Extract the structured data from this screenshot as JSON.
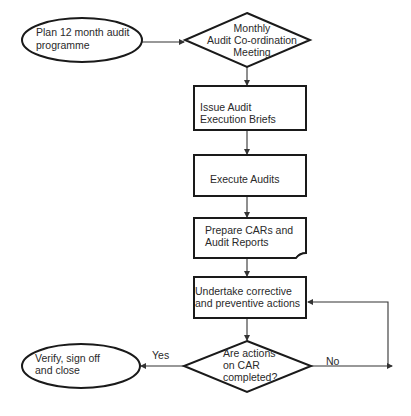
{
  "diagram": {
    "type": "flowchart",
    "title": "",
    "nodes": [
      {
        "id": "plan",
        "shape": "oval",
        "lines": [
          "Plan 12 month audit",
          "programme"
        ]
      },
      {
        "id": "meeting",
        "shape": "diamond",
        "lines": [
          "Monthly",
          "Audit Co-ordination",
          "Meeting"
        ]
      },
      {
        "id": "briefs",
        "shape": "rectangle",
        "lines": [
          "Issue Audit",
          "Execution Briefs"
        ]
      },
      {
        "id": "execute",
        "shape": "rectangle",
        "lines": [
          "Execute Audits"
        ]
      },
      {
        "id": "reports",
        "shape": "document",
        "lines": [
          "Prepare CARs and",
          "Audit Reports"
        ]
      },
      {
        "id": "corrective",
        "shape": "rectangle",
        "lines": [
          "Undertake corrective",
          "and preventive actions"
        ]
      },
      {
        "id": "decision",
        "shape": "diamond",
        "lines": [
          "Are actions",
          "on CAR",
          "completed?"
        ]
      },
      {
        "id": "close",
        "shape": "oval",
        "lines": [
          "Verify, sign off",
          "and close"
        ]
      }
    ],
    "edges": [
      {
        "from": "plan",
        "to": "meeting",
        "label": ""
      },
      {
        "from": "meeting",
        "to": "briefs",
        "label": ""
      },
      {
        "from": "briefs",
        "to": "execute",
        "label": ""
      },
      {
        "from": "execute",
        "to": "reports",
        "label": ""
      },
      {
        "from": "reports",
        "to": "corrective",
        "label": ""
      },
      {
        "from": "corrective",
        "to": "decision",
        "label": ""
      },
      {
        "from": "decision",
        "to": "close",
        "label": "Yes"
      },
      {
        "from": "decision",
        "to": "corrective",
        "label": "No"
      }
    ],
    "edge_labels": {
      "yes": "Yes",
      "no": "No"
    }
  }
}
